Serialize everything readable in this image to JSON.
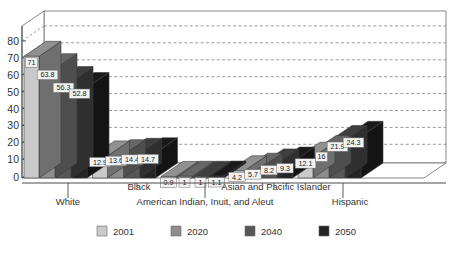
{
  "chart_data": {
    "type": "bar",
    "title": "",
    "subtitle": "",
    "xlabel": "",
    "ylabel": "",
    "ylim": [
      0,
      80
    ],
    "ytick_step": 10,
    "yticks": [
      "0",
      "10",
      "20",
      "30",
      "40",
      "50",
      "60",
      "70",
      "80"
    ],
    "grid": true,
    "grid_style": "dashed-horizontal",
    "three_d": true,
    "legend_position": "bottom",
    "categories": [
      "White",
      "Black",
      "American Indian, Inuit, and Aleut",
      "Asian and Pacific Islander",
      "Hispanic"
    ],
    "series": [
      {
        "name": "2001",
        "color": "#c9c9c9",
        "values": [
          71,
          12.9,
          0.9,
          4.2,
          12.1
        ]
      },
      {
        "name": "2020",
        "color": "#8d8d8d",
        "values": [
          63.8,
          13.6,
          1,
          5.7,
          16
        ]
      },
      {
        "name": "2040",
        "color": "#565656",
        "values": [
          56.3,
          14.4,
          1,
          8.2,
          21.9
        ]
      },
      {
        "name": "2050",
        "color": "#242424",
        "values": [
          52.8,
          14.7,
          1.1,
          9.3,
          24.3
        ]
      }
    ],
    "value_labels": [
      [
        "71",
        "63.8",
        "56.3",
        "52.8"
      ],
      [
        "12.9",
        "13.6",
        "14.4",
        "14.7"
      ],
      [
        "0.9",
        "1",
        "1",
        "1.1"
      ],
      [
        "4.2",
        "5.7",
        "8.2",
        "9.3"
      ],
      [
        "12.1",
        "16",
        "21.9",
        "24.3"
      ]
    ]
  },
  "legend": {
    "items": [
      {
        "label": "2001",
        "color": "#c9c9c9"
      },
      {
        "label": "2020",
        "color": "#8d8d8d"
      },
      {
        "label": "2040",
        "color": "#565656"
      },
      {
        "label": "2050",
        "color": "#242424"
      }
    ]
  },
  "axes": {
    "y": {
      "ticks": [
        "80",
        "70",
        "60",
        "50",
        "40",
        "30",
        "20",
        "10",
        "0"
      ]
    },
    "x": {
      "row_top": [
        {
          "label": "Black"
        },
        {
          "label": "Asian and Pacific Islander"
        }
      ],
      "row_bottom": [
        {
          "label": "White"
        },
        {
          "label": "American Indian, Inuit, and Aleut"
        },
        {
          "label": "Hispanic"
        }
      ]
    }
  },
  "colors": {
    "series_2001": "#c9c9c9",
    "series_2020": "#8d8d8d",
    "series_2040": "#565656",
    "series_2050": "#242424",
    "axis": "#555555",
    "grid": "#777777",
    "background": "#ffffff"
  }
}
